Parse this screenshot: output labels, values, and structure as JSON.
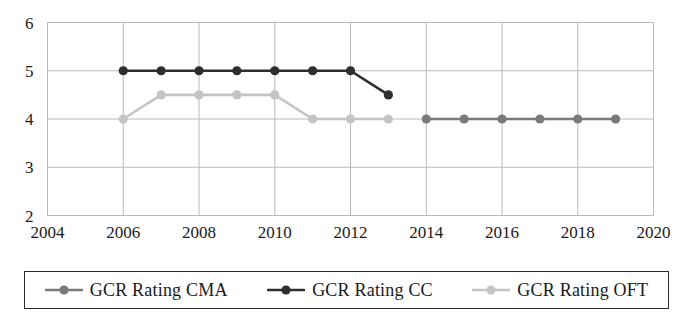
{
  "chart_data": {
    "type": "line",
    "title": "",
    "xlabel": "",
    "ylabel": "",
    "xlim": [
      2004,
      2020
    ],
    "ylim": [
      2,
      6
    ],
    "x_ticks": [
      2004,
      2006,
      2008,
      2010,
      2012,
      2014,
      2016,
      2018,
      2020
    ],
    "y_ticks": [
      2,
      3,
      4,
      5,
      6
    ],
    "grid": true,
    "legend_position": "bottom",
    "series": [
      {
        "name": "GCR Rating CMA",
        "color": "#7a7a7a",
        "x": [
          2014,
          2015,
          2016,
          2017,
          2018,
          2019
        ],
        "values": [
          4,
          4,
          4,
          4,
          4,
          4
        ]
      },
      {
        "name": "GCR Rating CC",
        "color": "#2e2e2e",
        "x": [
          2006,
          2007,
          2008,
          2009,
          2010,
          2011,
          2012,
          2013
        ],
        "values": [
          5,
          5,
          5,
          5,
          5,
          5,
          5,
          4.5
        ]
      },
      {
        "name": "GCR Rating OFT",
        "color": "#c4c4c4",
        "x": [
          2006,
          2007,
          2008,
          2009,
          2010,
          2011,
          2012,
          2013
        ],
        "values": [
          4,
          4.5,
          4.5,
          4.5,
          4.5,
          4,
          4,
          4
        ]
      }
    ]
  },
  "axis": {
    "y_labels": [
      "6",
      "5",
      "4",
      "3",
      "2"
    ],
    "x_labels": [
      "2004",
      "2006",
      "2008",
      "2010",
      "2012",
      "2014",
      "2016",
      "2018",
      "2020"
    ]
  },
  "legend": {
    "items": [
      {
        "label": "GCR Rating CMA",
        "color": "#7a7a7a",
        "marker": "circle-marker"
      },
      {
        "label": "GCR Rating CC",
        "color": "#2e2e2e",
        "marker": "circle-marker"
      },
      {
        "label": "GCR Rating OFT",
        "color": "#c4c4c4",
        "marker": "circle-marker"
      }
    ]
  },
  "colors": {
    "grid": "#b9b9b9",
    "axis_text": "#1a1a1a",
    "legend_border": "#2b2b2b",
    "background": "#ffffff"
  }
}
